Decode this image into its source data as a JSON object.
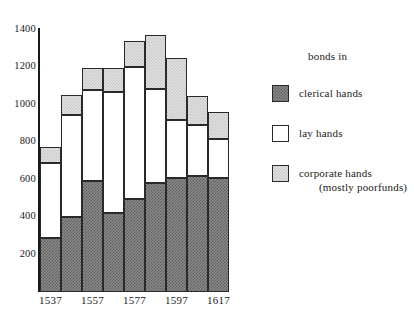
{
  "chart_data": {
    "type": "bar",
    "title": "",
    "subtitle": "",
    "xlabel": "",
    "ylabel": "",
    "ylim": [
      0,
      1400
    ],
    "yticks": [
      200,
      400,
      600,
      800,
      1000,
      1200,
      1400
    ],
    "grid": false,
    "stacked": true,
    "legend_position": "right",
    "categories": [
      "1537",
      "1547",
      "1557",
      "1567",
      "1577",
      "1587",
      "1597",
      "1607",
      "1617"
    ],
    "tick_labels_shown": [
      "1537",
      "1557",
      "1577",
      "1597",
      "1617"
    ],
    "series": [
      {
        "name": "clerical hands",
        "values": [
          290,
          400,
          595,
          420,
          495,
          580,
          610,
          620,
          610
        ]
      },
      {
        "name": "lay hands",
        "values": [
          400,
          545,
          485,
          650,
          705,
          505,
          310,
          270,
          205
        ]
      },
      {
        "name": "corporate hands (mostly poorfunds)",
        "values": [
          85,
          110,
          115,
          125,
          140,
          290,
          330,
          160,
          145
        ]
      }
    ],
    "segment_tops": [
      [
        290,
        690,
        775
      ],
      [
        400,
        945,
        1055
      ],
      [
        595,
        1080,
        1195
      ],
      [
        420,
        1070,
        1195
      ],
      [
        495,
        1200,
        1340
      ],
      [
        580,
        1085,
        1375
      ],
      [
        610,
        920,
        1250
      ],
      [
        620,
        890,
        1050
      ],
      [
        610,
        815,
        960
      ]
    ]
  },
  "axes": {
    "y_tick_labels": [
      "1400",
      "1200",
      "1000",
      "800",
      "600",
      "400",
      "200"
    ],
    "x_tick_labels": [
      "1537",
      "1557",
      "1577",
      "1597",
      "1617"
    ]
  },
  "legend": {
    "title": "bonds in",
    "items": [
      {
        "label": "clerical hands",
        "sub": "",
        "swatch": "clerical"
      },
      {
        "label": "lay hands",
        "sub": "",
        "swatch": "lay"
      },
      {
        "label": "corporate hands",
        "sub": "(mostly poorfunds)",
        "swatch": "corporate"
      }
    ]
  },
  "colors": {
    "ink": "#1a1a1a",
    "clerical_fill": "#7a7a7a",
    "lay_fill": "#ffffff",
    "corporate_fill": "#d8d8d8",
    "background": "#ffffff"
  }
}
